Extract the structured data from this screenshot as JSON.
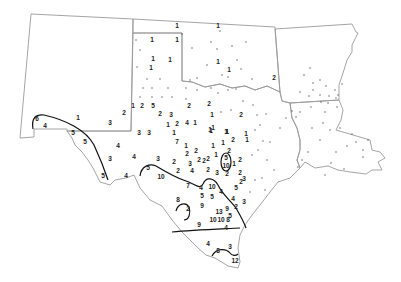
{
  "map": {
    "regions": [
      "New Mexico",
      "Texas",
      "Oklahoma",
      "Arkansas",
      "Louisiana"
    ],
    "isoline_color": "#111111",
    "boundary_color": "#9a9a9a",
    "labels": [
      {
        "v": "1",
        "x": 177,
        "y": 26
      },
      {
        "v": "1",
        "x": 152,
        "y": 40
      },
      {
        "v": "1",
        "x": 177,
        "y": 40
      },
      {
        "v": "1",
        "x": 153,
        "y": 59
      },
      {
        "v": "1",
        "x": 170,
        "y": 60
      },
      {
        "v": "1",
        "x": 151,
        "y": 68
      },
      {
        "v": "1",
        "x": 218,
        "y": 26
      },
      {
        "v": "1",
        "x": 218,
        "y": 62
      },
      {
        "v": "1",
        "x": 229,
        "y": 70
      },
      {
        "v": "2",
        "x": 274,
        "y": 78
      },
      {
        "v": "2",
        "x": 209,
        "y": 104
      },
      {
        "v": "1",
        "x": 212,
        "y": 115
      },
      {
        "v": "2",
        "x": 241,
        "y": 115
      },
      {
        "v": "1",
        "x": 211,
        "y": 131
      },
      {
        "v": "1",
        "x": 227,
        "y": 132
      },
      {
        "v": "1",
        "x": 246,
        "y": 134
      },
      {
        "v": "1",
        "x": 133,
        "y": 106
      },
      {
        "v": "2",
        "x": 142,
        "y": 106
      },
      {
        "v": "5",
        "x": 153,
        "y": 106
      },
      {
        "v": "2",
        "x": 189,
        "y": 106
      },
      {
        "v": "2",
        "x": 124,
        "y": 113
      },
      {
        "v": "2",
        "x": 160,
        "y": 114
      },
      {
        "v": "3",
        "x": 171,
        "y": 115
      },
      {
        "v": "1",
        "x": 78,
        "y": 118
      },
      {
        "v": "3",
        "x": 110,
        "y": 123
      },
      {
        "v": "1",
        "x": 168,
        "y": 125
      },
      {
        "v": "2",
        "x": 177,
        "y": 124
      },
      {
        "v": "4",
        "x": 187,
        "y": 123
      },
      {
        "v": "1",
        "x": 195,
        "y": 123
      },
      {
        "v": "1",
        "x": 213,
        "y": 128
      },
      {
        "v": "1",
        "x": 226,
        "y": 132
      },
      {
        "v": "3",
        "x": 139,
        "y": 133
      },
      {
        "v": "3",
        "x": 149,
        "y": 133
      },
      {
        "v": "1",
        "x": 174,
        "y": 133
      },
      {
        "v": "1",
        "x": 210,
        "y": 130
      },
      {
        "v": "1",
        "x": 227,
        "y": 132
      },
      {
        "v": "6",
        "x": 37,
        "y": 119
      },
      {
        "v": "4",
        "x": 45,
        "y": 126
      },
      {
        "v": "5",
        "x": 73,
        "y": 133
      },
      {
        "v": "5",
        "x": 85,
        "y": 142
      },
      {
        "v": "4",
        "x": 118,
        "y": 146
      },
      {
        "v": "3",
        "x": 110,
        "y": 159
      },
      {
        "v": "4",
        "x": 134,
        "y": 157
      },
      {
        "v": "3",
        "x": 158,
        "y": 159
      },
      {
        "v": "2",
        "x": 174,
        "y": 162
      },
      {
        "v": "7",
        "x": 177,
        "y": 142
      },
      {
        "v": "1",
        "x": 186,
        "y": 146
      },
      {
        "v": "2",
        "x": 196,
        "y": 151
      },
      {
        "v": "1",
        "x": 213,
        "y": 146
      },
      {
        "v": "1",
        "x": 223,
        "y": 143
      },
      {
        "v": "2",
        "x": 233,
        "y": 140
      },
      {
        "v": "1",
        "x": 247,
        "y": 140
      },
      {
        "v": "2",
        "x": 187,
        "y": 154
      },
      {
        "v": "2",
        "x": 199,
        "y": 160
      },
      {
        "v": "2",
        "x": 208,
        "y": 159
      },
      {
        "v": "1",
        "x": 216,
        "y": 155
      },
      {
        "v": "2",
        "x": 229,
        "y": 151
      },
      {
        "v": "3",
        "x": 190,
        "y": 164
      },
      {
        "v": "2",
        "x": 204,
        "y": 161
      },
      {
        "v": "5",
        "x": 226,
        "y": 158
      },
      {
        "v": "10",
        "x": 226,
        "y": 166
      },
      {
        "v": "1",
        "x": 234,
        "y": 164
      },
      {
        "v": "2",
        "x": 240,
        "y": 160
      },
      {
        "v": "4",
        "x": 126,
        "y": 176
      },
      {
        "v": "5",
        "x": 148,
        "y": 168
      },
      {
        "v": "10",
        "x": 161,
        "y": 177
      },
      {
        "v": "2",
        "x": 178,
        "y": 171
      },
      {
        "v": "4",
        "x": 192,
        "y": 171
      },
      {
        "v": "2",
        "x": 208,
        "y": 170
      },
      {
        "v": "3",
        "x": 217,
        "y": 173
      },
      {
        "v": "2",
        "x": 227,
        "y": 174
      },
      {
        "v": "5",
        "x": 103,
        "y": 176
      },
      {
        "v": "7",
        "x": 188,
        "y": 186
      },
      {
        "v": "4",
        "x": 201,
        "y": 188
      },
      {
        "v": "10",
        "x": 212,
        "y": 187
      },
      {
        "v": "4",
        "x": 221,
        "y": 192
      },
      {
        "v": "5",
        "x": 236,
        "y": 188
      },
      {
        "v": "5",
        "x": 202,
        "y": 196
      },
      {
        "v": "5",
        "x": 212,
        "y": 197
      },
      {
        "v": "2",
        "x": 241,
        "y": 182
      },
      {
        "v": "4",
        "x": 233,
        "y": 199
      },
      {
        "v": "3",
        "x": 244,
        "y": 202
      },
      {
        "v": "8",
        "x": 178,
        "y": 200
      },
      {
        "v": "2",
        "x": 188,
        "y": 209
      },
      {
        "v": "9",
        "x": 202,
        "y": 206
      },
      {
        "v": "13",
        "x": 219,
        "y": 212
      },
      {
        "v": "9",
        "x": 227,
        "y": 209
      },
      {
        "v": "2",
        "x": 236,
        "y": 207
      },
      {
        "v": "5",
        "x": 230,
        "y": 216
      },
      {
        "v": "9",
        "x": 199,
        "y": 225
      },
      {
        "v": "10",
        "x": 213,
        "y": 220
      },
      {
        "v": "10",
        "x": 221,
        "y": 220
      },
      {
        "v": "8",
        "x": 228,
        "y": 220
      },
      {
        "v": "4",
        "x": 226,
        "y": 228
      },
      {
        "v": "4",
        "x": 208,
        "y": 244
      },
      {
        "v": "8",
        "x": 218,
        "y": 251
      },
      {
        "v": "3",
        "x": 230,
        "y": 247
      },
      {
        "v": "12",
        "x": 235,
        "y": 261
      },
      {
        "v": "3",
        "x": 244,
        "y": 179
      },
      {
        "v": "2",
        "x": 240,
        "y": 173
      }
    ],
    "dots": [
      [
        136,
        40
      ],
      [
        140,
        50
      ],
      [
        137,
        67
      ],
      [
        147,
        79
      ],
      [
        160,
        79
      ],
      [
        143,
        88
      ],
      [
        152,
        88
      ],
      [
        168,
        88
      ],
      [
        172,
        97
      ],
      [
        140,
        97
      ],
      [
        152,
        97
      ],
      [
        162,
        97
      ],
      [
        186,
        99
      ],
      [
        186,
        88
      ],
      [
        190,
        80
      ],
      [
        182,
        34
      ],
      [
        192,
        48
      ],
      [
        197,
        78
      ],
      [
        207,
        65
      ],
      [
        211,
        42
      ],
      [
        217,
        49
      ],
      [
        220,
        31
      ],
      [
        222,
        75
      ],
      [
        228,
        77
      ],
      [
        232,
        46
      ],
      [
        246,
        42
      ],
      [
        241,
        69
      ],
      [
        237,
        60
      ],
      [
        252,
        79
      ],
      [
        236,
        89
      ],
      [
        228,
        90
      ],
      [
        218,
        93
      ],
      [
        243,
        101
      ],
      [
        231,
        110
      ],
      [
        221,
        112
      ],
      [
        253,
        105
      ],
      [
        257,
        115
      ],
      [
        260,
        125
      ],
      [
        255,
        130
      ],
      [
        263,
        141
      ],
      [
        258,
        150
      ],
      [
        252,
        155
      ],
      [
        270,
        142
      ],
      [
        267,
        160
      ],
      [
        274,
        170
      ],
      [
        262,
        178
      ],
      [
        255,
        180
      ],
      [
        265,
        190
      ],
      [
        250,
        192
      ],
      [
        266,
        114
      ],
      [
        211,
        88
      ],
      [
        197,
        90
      ],
      [
        310,
        68
      ],
      [
        304,
        75
      ],
      [
        313,
        83
      ],
      [
        320,
        80
      ],
      [
        326,
        86
      ],
      [
        335,
        90
      ],
      [
        313,
        90
      ],
      [
        320,
        95
      ],
      [
        300,
        92
      ],
      [
        309,
        96
      ],
      [
        329,
        96
      ],
      [
        336,
        98
      ],
      [
        321,
        102
      ],
      [
        338,
        95
      ],
      [
        328,
        103
      ],
      [
        342,
        84
      ],
      [
        311,
        107
      ],
      [
        325,
        112
      ],
      [
        337,
        107
      ],
      [
        300,
        112
      ],
      [
        296,
        117
      ],
      [
        292,
        111
      ],
      [
        286,
        118
      ],
      [
        323,
        123
      ],
      [
        312,
        128
      ],
      [
        330,
        130
      ],
      [
        340,
        128
      ],
      [
        352,
        134
      ],
      [
        347,
        146
      ],
      [
        356,
        142
      ],
      [
        363,
        150
      ],
      [
        368,
        140
      ],
      [
        363,
        157
      ],
      [
        336,
        152
      ],
      [
        344,
        169
      ],
      [
        331,
        163
      ],
      [
        325,
        175
      ],
      [
        308,
        152
      ],
      [
        302,
        160
      ],
      [
        298,
        167
      ],
      [
        320,
        140
      ],
      [
        280,
        128
      ]
    ]
  }
}
